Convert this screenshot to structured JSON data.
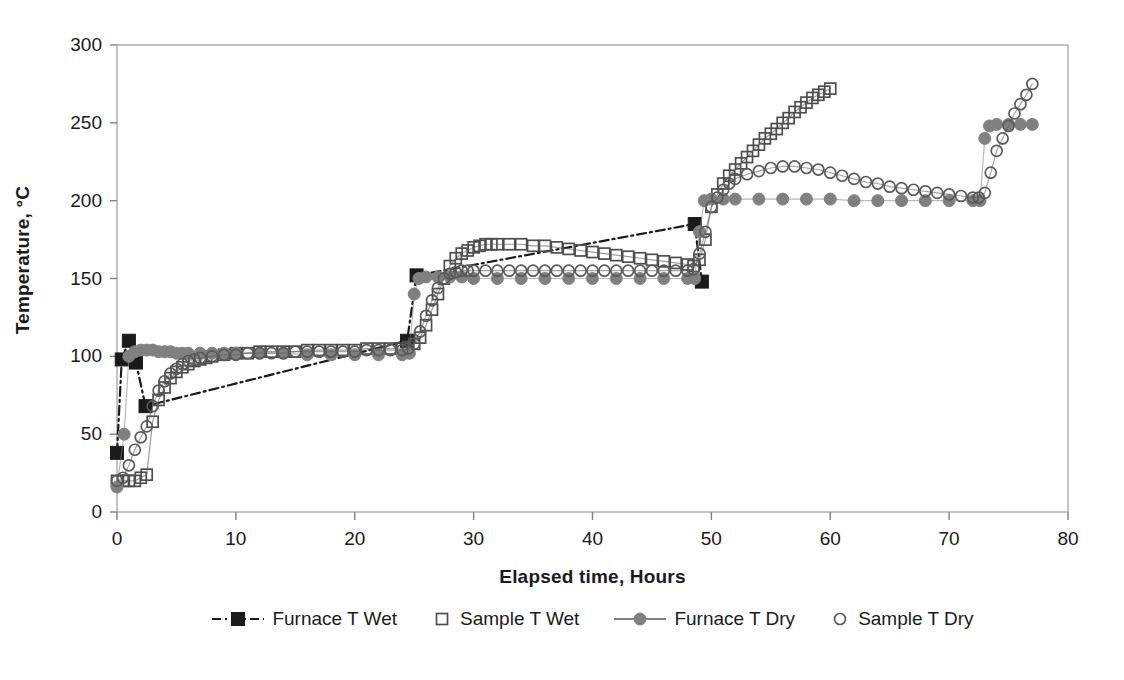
{
  "chart_data": {
    "type": "line",
    "title": "",
    "xlabel": "Elapsed time, Hours",
    "ylabel": "Temperature, °C",
    "xlim": [
      0,
      80
    ],
    "ylim": [
      0,
      300
    ],
    "xticks": [
      0,
      10,
      20,
      30,
      40,
      50,
      60,
      70,
      80
    ],
    "yticks": [
      0,
      50,
      100,
      150,
      200,
      250,
      300
    ],
    "grid": false,
    "legend_position": "bottom",
    "colors": {
      "furnace_wet": "#1a1a1a",
      "sample_wet": "#4d4d4d",
      "furnace_dry": "#808080",
      "sample_dry": "#595959",
      "axis": "#808080",
      "frame": "#aaaaaa"
    },
    "series": [
      {
        "name": "Furnace T Wet",
        "marker": "filled-square",
        "color": "#1a1a1a",
        "linestyle": "dash-dot",
        "x": [
          0.0,
          0.4,
          1.0,
          1.6,
          2.4,
          24.4,
          25.2,
          48.6,
          49.2
        ],
        "y": [
          38,
          98,
          110,
          96,
          68,
          110,
          152,
          185,
          148
        ]
      },
      {
        "name": "Sample T Wet",
        "marker": "open-square",
        "color": "#4d4d4d",
        "linestyle": "solid",
        "x": [
          0.0,
          0.5,
          1.0,
          1.5,
          2.0,
          2.5,
          3.0,
          3.5,
          4.0,
          4.5,
          5.0,
          5.5,
          6.0,
          6.5,
          7.0,
          7.5,
          8.0,
          9.0,
          10.0,
          11.0,
          12.0,
          13.0,
          14.0,
          15.0,
          16.0,
          17.0,
          18.0,
          19.0,
          20.0,
          21.0,
          22.0,
          23.0,
          24.0,
          24.5,
          25.0,
          25.5,
          26.0,
          26.5,
          27.0,
          27.5,
          28.0,
          28.5,
          29.0,
          29.5,
          30.0,
          30.5,
          31.0,
          31.5,
          32.0,
          33.0,
          34.0,
          35.0,
          36.0,
          37.0,
          38.0,
          39.0,
          40.0,
          41.0,
          42.0,
          43.0,
          44.0,
          45.0,
          46.0,
          47.0,
          48.0,
          48.5,
          49.0,
          49.5,
          50.0,
          50.5,
          51.0,
          51.5,
          52.0,
          52.5,
          53.0,
          53.5,
          54.0,
          54.5,
          55.0,
          55.5,
          56.0,
          56.5,
          57.0,
          57.5,
          58.0,
          58.5,
          59.0,
          59.5,
          60.0
        ],
        "y": [
          20,
          20,
          20,
          20,
          22,
          24,
          58,
          72,
          80,
          86,
          90,
          93,
          95,
          97,
          98,
          99,
          100,
          101,
          102,
          102,
          103,
          103,
          103,
          103,
          104,
          104,
          104,
          104,
          104,
          105,
          105,
          105,
          105,
          106,
          108,
          112,
          120,
          130,
          140,
          150,
          158,
          163,
          166,
          168,
          170,
          171,
          172,
          172,
          172,
          172,
          172,
          171,
          171,
          170,
          169,
          168,
          167,
          166,
          165,
          164,
          163,
          162,
          161,
          160,
          159,
          158,
          162,
          175,
          196,
          204,
          211,
          216,
          220,
          224,
          228,
          232,
          236,
          240,
          243,
          246,
          250,
          253,
          257,
          260,
          263,
          266,
          268,
          270,
          272
        ]
      },
      {
        "name": "Furnace T Dry",
        "marker": "filled-circle",
        "color": "#808080",
        "linestyle": "solid",
        "x": [
          0.0,
          0.6,
          1.0,
          1.5,
          2.0,
          2.5,
          3.0,
          3.5,
          4.0,
          4.5,
          5.0,
          5.5,
          6.0,
          7.0,
          8.0,
          9.0,
          10.0,
          12.0,
          14.0,
          16.0,
          18.0,
          20.0,
          22.0,
          24.0,
          24.6,
          25.0,
          25.4,
          26.0,
          27.0,
          28.0,
          29.0,
          30.0,
          32.0,
          34.0,
          36.0,
          38.0,
          40.0,
          42.0,
          44.0,
          46.0,
          48.0,
          48.6,
          49.0,
          49.4,
          50.0,
          51.0,
          52.0,
          54.0,
          56.0,
          58.0,
          60.0,
          62.0,
          64.0,
          66.0,
          68.0,
          70.0,
          72.0,
          72.6,
          73.0,
          73.4,
          74.0,
          75.0,
          76.0,
          77.0
        ],
        "y": [
          16,
          50,
          100,
          103,
          104,
          104,
          104,
          103,
          103,
          103,
          102,
          102,
          102,
          102,
          102,
          102,
          102,
          102,
          102,
          101,
          101,
          101,
          101,
          101,
          102,
          140,
          150,
          151,
          151,
          151,
          151,
          150,
          150,
          150,
          150,
          150,
          150,
          150,
          150,
          150,
          150,
          150,
          180,
          200,
          201,
          201,
          201,
          201,
          201,
          201,
          201,
          200,
          200,
          200,
          200,
          200,
          200,
          200,
          240,
          248,
          249,
          249,
          249,
          249
        ]
      },
      {
        "name": "Sample T Dry",
        "marker": "open-circle",
        "color": "#595959",
        "linestyle": "solid",
        "x": [
          0.0,
          0.5,
          1.0,
          1.5,
          2.0,
          2.5,
          3.0,
          3.5,
          4.0,
          4.5,
          5.0,
          5.5,
          6.0,
          6.5,
          7.0,
          8.0,
          9.0,
          10.0,
          11.0,
          12.0,
          13.0,
          14.0,
          15.0,
          16.0,
          17.0,
          18.0,
          19.0,
          20.0,
          21.0,
          22.0,
          23.0,
          24.0,
          24.5,
          25.0,
          25.5,
          26.0,
          26.5,
          27.0,
          27.5,
          28.0,
          28.5,
          29.0,
          29.5,
          30.0,
          31.0,
          32.0,
          33.0,
          34.0,
          35.0,
          36.0,
          37.0,
          38.0,
          39.0,
          40.0,
          41.0,
          42.0,
          43.0,
          44.0,
          45.0,
          46.0,
          47.0,
          48.0,
          48.5,
          49.0,
          49.5,
          50.0,
          50.5,
          51.0,
          51.5,
          52.0,
          53.0,
          54.0,
          55.0,
          56.0,
          57.0,
          58.0,
          59.0,
          60.0,
          61.0,
          62.0,
          63.0,
          64.0,
          65.0,
          66.0,
          67.0,
          68.0,
          69.0,
          70.0,
          71.0,
          72.0,
          72.5,
          73.0,
          73.5,
          74.0,
          74.5,
          75.0,
          75.5,
          76.0,
          76.5,
          77.0
        ],
        "y": [
          20,
          22,
          30,
          40,
          48,
          55,
          68,
          78,
          84,
          89,
          92,
          95,
          97,
          98,
          99,
          100,
          101,
          101,
          102,
          102,
          102,
          102,
          103,
          103,
          103,
          103,
          103,
          103,
          104,
          104,
          104,
          104,
          105,
          108,
          116,
          126,
          136,
          144,
          150,
          153,
          154,
          155,
          155,
          155,
          155,
          155,
          155,
          155,
          155,
          155,
          155,
          155,
          155,
          155,
          155,
          155,
          155,
          155,
          155,
          155,
          155,
          155,
          156,
          166,
          180,
          196,
          202,
          207,
          211,
          214,
          217,
          219,
          221,
          222,
          222,
          221,
          220,
          218,
          216,
          214,
          212,
          211,
          209,
          208,
          207,
          206,
          205,
          204,
          203,
          202,
          202,
          205,
          218,
          232,
          240,
          248,
          256,
          262,
          268,
          275
        ]
      }
    ]
  }
}
